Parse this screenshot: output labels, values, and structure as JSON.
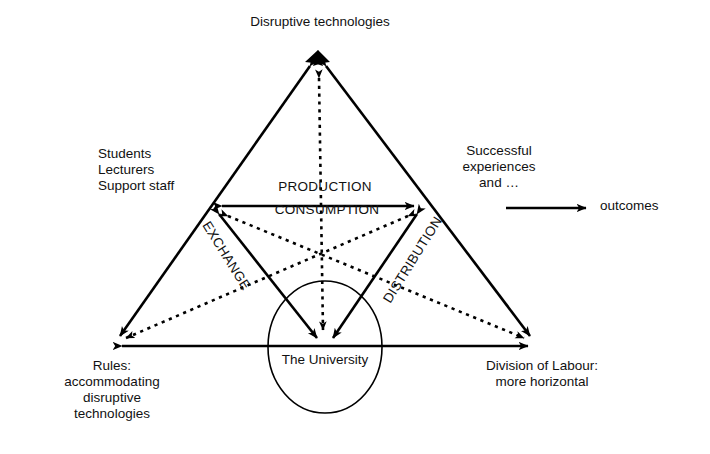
{
  "diagram": {
    "title_note": "Activity system triangle diagram",
    "nodes": {
      "top": "Disruptive technologies",
      "left": "Students\nLecturers\nSupport staff",
      "right": "Successful\nexperiences\nand …",
      "bottom_left": "Rules:\naccommodating\ndisruptive\ntechnologies",
      "bottom_right": "Division of Labour:\nmore horizontal",
      "center": "The University",
      "outcomes": "outcomes"
    },
    "edge_labels": {
      "production": "PRODUCTION",
      "consumption": "CONSUMPTION",
      "exchange": "EXCHANGE",
      "distribution": "DISTRIBUTION"
    },
    "colors": {
      "ink": "#000000",
      "background": "#ffffff"
    },
    "geometry": {
      "apex": [
        318,
        56
      ],
      "mid_left": [
        212,
        206
      ],
      "mid_right": [
        424,
        206
      ],
      "bottom_left": [
        112,
        346
      ],
      "bottom_right": [
        538,
        346
      ],
      "center": [
        325,
        347
      ],
      "ellipse_rx": 57,
      "ellipse_ry": 66,
      "outcomes_arrow": [
        506,
        208,
        592,
        208
      ]
    }
  }
}
